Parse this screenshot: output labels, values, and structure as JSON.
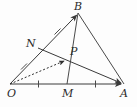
{
  "figure": {
    "type": "geometry-diagram",
    "background_color": "#fdfdfd",
    "stroke_color": "#404040",
    "label_color": "#2b2b2b",
    "points": [
      {
        "id": "O",
        "label": "O",
        "x": 10,
        "y": 84,
        "label_x": 7,
        "label_y": 97
      },
      {
        "id": "A",
        "label": "A",
        "x": 124,
        "y": 84,
        "label_x": 122,
        "label_y": 97
      },
      {
        "id": "B",
        "label": "B",
        "x": 78,
        "y": 13,
        "label_x": 76,
        "label_y": 9
      },
      {
        "id": "M",
        "label": "M",
        "x": 67,
        "y": 84,
        "label_x": 65,
        "label_y": 97
      },
      {
        "id": "N",
        "label": "N",
        "x": 38,
        "y": 48,
        "label_x": 27,
        "label_y": 46
      },
      {
        "id": "P",
        "label": "P",
        "x": 68,
        "y": 58,
        "label_x": 72,
        "label_y": 54
      }
    ],
    "segments": [
      {
        "id": "OB",
        "from": "O",
        "to": "B",
        "style": "solid",
        "arrow": "end"
      },
      {
        "id": "OA",
        "from": "O",
        "to": "A",
        "style": "solid",
        "arrow": "end"
      },
      {
        "id": "BA",
        "from": "B",
        "to": "A",
        "style": "solid",
        "arrow": "none"
      },
      {
        "id": "MB",
        "from": "M",
        "to": "B",
        "style": "solid",
        "arrow": "none"
      },
      {
        "id": "NA",
        "from": "N",
        "to": "A",
        "style": "solid",
        "arrow": "end"
      },
      {
        "id": "OP",
        "from": "O",
        "to": "P",
        "style": "dotted",
        "arrow": "end"
      }
    ],
    "tick_marks": [
      {
        "id": "tick-ON",
        "on": "OB",
        "note": "single tick marking ON"
      },
      {
        "id": "tick-NB",
        "on": "OB",
        "note": "single tick marking NB"
      },
      {
        "id": "tick-OM",
        "on": "OA",
        "note": "single tick marking OM"
      },
      {
        "id": "tick-MA",
        "on": "OA",
        "note": "single tick marking MA"
      }
    ],
    "relations": [
      "N is the midpoint of OB",
      "M is the midpoint of OA",
      "P is the intersection of NA and MB"
    ]
  }
}
